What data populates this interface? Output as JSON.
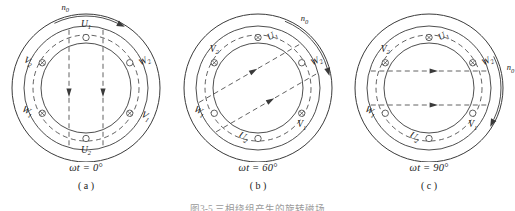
{
  "figure": {
    "bottom_caption": "图3-5 三相绕组产生的旋转磁场",
    "panels": [
      {
        "id": "a",
        "letter": "( a )",
        "phase_label": "ωt = 0°",
        "phase_value_deg": 0,
        "rotation_label": "n",
        "rotation_sub": "0",
        "rotation_position": "top",
        "field_direction_deg": 270,
        "field_label": "downward",
        "conductors": [
          {
            "name": "U1",
            "letter": "U",
            "sub": "1",
            "angle_deg": 90,
            "symbol": "dot",
            "label_pos": "above"
          },
          {
            "name": "W2",
            "letter": "W",
            "sub": "2",
            "angle_deg": 30,
            "symbol": "dot",
            "label_pos": "right"
          },
          {
            "name": "V1",
            "letter": "V",
            "sub": "1",
            "angle_deg": -30,
            "symbol": "cross",
            "label_pos": "right"
          },
          {
            "name": "U2",
            "letter": "U",
            "sub": "2",
            "angle_deg": -90,
            "symbol": "dot",
            "label_pos": "below"
          },
          {
            "name": "W1",
            "letter": "W",
            "sub": "1",
            "angle_deg": 210,
            "symbol": "cross",
            "label_pos": "left"
          },
          {
            "name": "V2",
            "letter": "V",
            "sub": "2",
            "angle_deg": 150,
            "symbol": "cross",
            "label_pos": "left"
          }
        ]
      },
      {
        "id": "b",
        "letter": "( b )",
        "phase_label": "ωt = 60°",
        "phase_value_deg": 60,
        "rotation_label": "n",
        "rotation_sub": "0",
        "rotation_position": "upper-right",
        "field_direction_deg": 30,
        "field_label": "diagonal-up-right",
        "conductors": [
          {
            "name": "U1",
            "letter": "U",
            "sub": "1",
            "angle_deg": 90,
            "symbol": "cross",
            "label_pos": "right"
          },
          {
            "name": "W2",
            "letter": "W",
            "sub": "2",
            "angle_deg": 30,
            "symbol": "dot",
            "label_pos": "right"
          },
          {
            "name": "V1",
            "letter": "V",
            "sub": "1",
            "angle_deg": -30,
            "symbol": "cross",
            "label_pos": "below"
          },
          {
            "name": "U2",
            "letter": "U",
            "sub": "2",
            "angle_deg": -90,
            "symbol": "dot",
            "label_pos": "left"
          },
          {
            "name": "W1",
            "letter": "W",
            "sub": "1",
            "angle_deg": 210,
            "symbol": "dot",
            "label_pos": "left"
          },
          {
            "name": "V2",
            "letter": "V",
            "sub": "2",
            "angle_deg": 150,
            "symbol": "cross",
            "label_pos": "above"
          }
        ]
      },
      {
        "id": "c",
        "letter": "( c )",
        "phase_label": "ωt = 90°",
        "phase_value_deg": 90,
        "rotation_label": "n",
        "rotation_sub": "0",
        "rotation_position": "right",
        "field_direction_deg": 0,
        "field_label": "rightward",
        "conductors": [
          {
            "name": "U1",
            "letter": "U",
            "sub": "1",
            "angle_deg": 90,
            "symbol": "cross",
            "label_pos": "right"
          },
          {
            "name": "W2",
            "letter": "W",
            "sub": "2",
            "angle_deg": 30,
            "symbol": "cross",
            "label_pos": "right"
          },
          {
            "name": "V1",
            "letter": "V",
            "sub": "1",
            "angle_deg": -30,
            "symbol": "dot",
            "label_pos": "below"
          },
          {
            "name": "U2",
            "letter": "U",
            "sub": "2",
            "angle_deg": -90,
            "symbol": "dot",
            "label_pos": "left"
          },
          {
            "name": "W1",
            "letter": "W",
            "sub": "1",
            "angle_deg": 210,
            "symbol": "dot",
            "label_pos": "left"
          },
          {
            "name": "V2",
            "letter": "V",
            "sub": "2",
            "angle_deg": 150,
            "symbol": "cross",
            "label_pos": "above"
          }
        ]
      }
    ]
  },
  "geometry": {
    "cx": 86,
    "cy": 88,
    "r_outer": 74,
    "r_stator": 62,
    "r_slot": 53,
    "r_bore": 45,
    "stroke": "#3a3a3a"
  }
}
